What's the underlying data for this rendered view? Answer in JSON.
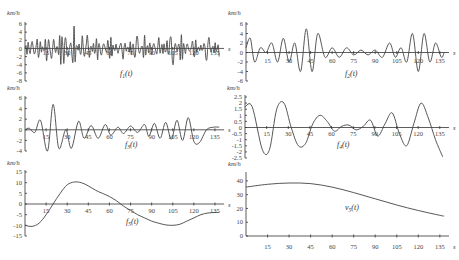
{
  "chart_data": [
    {
      "type": "line",
      "title": "f1(t)",
      "xlabel": "s",
      "ylabel": "km/h",
      "x_ticks": [
        15,
        30,
        45,
        60,
        75,
        90,
        105,
        120,
        135
      ],
      "y_ticks": [
        6,
        4,
        2,
        0,
        -2,
        -4,
        -6,
        -8
      ],
      "ylim": [
        -8,
        6
      ],
      "xlim": [
        0,
        140
      ],
      "description": "High-frequency oscillation, amplitude mostly within ±5 km/h",
      "series": [
        {
          "name": "f1(t)",
          "x": [
            0,
            5,
            10,
            15,
            20,
            25,
            30,
            35,
            40,
            45,
            50,
            55,
            60,
            65,
            70,
            75,
            80,
            85,
            90,
            95,
            100,
            105,
            110,
            115,
            120,
            125,
            130,
            135,
            138
          ],
          "values": [
            0,
            3,
            -3,
            4,
            -4,
            3,
            5,
            -6,
            5,
            -4,
            4,
            -3,
            3,
            -2,
            2,
            -2,
            4,
            -3,
            3,
            -2,
            4,
            -5,
            4,
            -2,
            2,
            -1,
            3,
            -2,
            1
          ]
        }
      ]
    },
    {
      "type": "line",
      "title": "f2(t)",
      "xlabel": "s",
      "ylabel": "km/h",
      "x_ticks": [
        15,
        30,
        45,
        60,
        75,
        90,
        105,
        120,
        135
      ],
      "y_ticks": [
        6,
        4,
        2,
        0,
        -2,
        -4,
        -6
      ],
      "ylim": [
        -6,
        6
      ],
      "xlim": [
        0,
        140
      ],
      "series": [
        {
          "name": "f2(t)",
          "x": [
            0,
            3,
            6,
            10,
            14,
            18,
            22,
            26,
            30,
            34,
            38,
            42,
            46,
            50,
            55,
            60,
            65,
            70,
            75,
            80,
            85,
            90,
            95,
            100,
            104,
            108,
            112,
            116,
            120,
            124,
            128,
            132,
            136,
            138
          ],
          "values": [
            1,
            3,
            -2,
            1,
            0,
            2,
            -2,
            3,
            -2,
            2,
            -4,
            5,
            -4,
            4,
            -1,
            1,
            -1,
            1,
            -0.5,
            0.5,
            -0.5,
            0.5,
            -1,
            2,
            -1,
            1,
            -2,
            4,
            -4,
            4,
            -2,
            2,
            -1,
            0
          ]
        }
      ]
    },
    {
      "type": "line",
      "title": "f3(t)",
      "xlabel": "s",
      "ylabel": "km/h",
      "x_ticks": [
        15,
        30,
        45,
        60,
        75,
        90,
        105,
        120,
        135
      ],
      "y_ticks": [
        6,
        4,
        2,
        0,
        -2,
        -4
      ],
      "ylim": [
        -4,
        6
      ],
      "xlim": [
        0,
        140
      ],
      "series": [
        {
          "name": "f3(t)",
          "x": [
            0,
            3,
            7,
            11,
            16,
            20,
            24,
            29,
            33,
            38,
            42,
            47,
            52,
            57,
            61,
            66,
            70,
            75,
            80,
            85,
            88,
            92,
            96,
            100,
            104,
            108,
            112,
            116,
            120,
            124,
            129,
            134,
            138
          ],
          "values": [
            0,
            0.3,
            -0.5,
            1.8,
            -4,
            4.8,
            -3.5,
            0,
            -3.5,
            1.6,
            -1.6,
            0.8,
            -1.6,
            1,
            -1,
            0.5,
            -0.7,
            0.7,
            -0.5,
            1,
            -1.2,
            1.2,
            -1.6,
            1.4,
            -1.8,
            1.8,
            -2,
            2.3,
            -2.2,
            -2.4,
            0,
            0.5,
            0.5
          ]
        }
      ]
    },
    {
      "type": "line",
      "title": "f4(t)",
      "xlabel": "s",
      "ylabel": "km/h",
      "x_ticks": [
        15,
        30,
        45,
        60,
        75,
        90,
        105,
        120,
        135
      ],
      "y_ticks": [
        2.5,
        2,
        1.5,
        1,
        0.5,
        0,
        -0.5,
        -1,
        -1.5,
        -2,
        -2.5
      ],
      "ylim": [
        -2.5,
        2.5
      ],
      "xlim": [
        0,
        140
      ],
      "series": [
        {
          "name": "f4(t)",
          "x": [
            0,
            5,
            12,
            17,
            22,
            27,
            32,
            37,
            42,
            47,
            52,
            57,
            62,
            67,
            72,
            77,
            82,
            87,
            92,
            97,
            102,
            107,
            112,
            117,
            122,
            127,
            132,
            137
          ],
          "values": [
            1.7,
            1.7,
            -1.8,
            -1.8,
            1.5,
            2,
            0,
            -1.5,
            -1.3,
            0.3,
            1.0,
            0.5,
            -0.3,
            0.1,
            0.2,
            -0.2,
            0.1,
            0.6,
            -0.7,
            0.3,
            1.2,
            -0.5,
            -1.5,
            0.3,
            2,
            0.8,
            -1,
            -2.4
          ]
        }
      ]
    },
    {
      "type": "line",
      "title": "f5(t)",
      "xlabel": "s",
      "ylabel": "km/h",
      "x_ticks": [
        15,
        30,
        45,
        60,
        75,
        90,
        105,
        120,
        135
      ],
      "y_ticks": [
        15,
        10,
        5,
        0,
        -5,
        -10,
        -15
      ],
      "ylim": [
        -15,
        15
      ],
      "xlim": [
        0,
        140
      ],
      "series": [
        {
          "name": "f5(t)",
          "x": [
            0,
            5,
            10,
            15,
            20,
            25,
            30,
            35,
            40,
            45,
            50,
            55,
            60,
            65,
            70,
            75,
            80,
            85,
            90,
            95,
            100,
            105,
            110,
            115,
            120,
            125,
            130,
            135,
            138
          ],
          "values": [
            -10,
            -10.5,
            -9,
            -5,
            0,
            5,
            9,
            10.3,
            10,
            8.5,
            6.5,
            5,
            3.5,
            1.5,
            -1,
            -3,
            -5,
            -6.5,
            -8,
            -9,
            -9.8,
            -10,
            -9.5,
            -8,
            -6.5,
            -5,
            -4.2,
            -4,
            -4
          ]
        }
      ]
    },
    {
      "type": "line",
      "title": "v5(t)",
      "xlabel": "s",
      "ylabel": "km/h",
      "x_ticks": [
        15,
        30,
        45,
        60,
        75,
        90,
        105,
        120,
        135
      ],
      "y_ticks": [
        0,
        10,
        20,
        30,
        40
      ],
      "ylim": [
        0,
        45
      ],
      "xlim": [
        0,
        140
      ],
      "series": [
        {
          "name": "v5(t)",
          "x": [
            0,
            15,
            30,
            45,
            60,
            75,
            90,
            105,
            120,
            135,
            138
          ],
          "values": [
            35.5,
            37.5,
            38.5,
            38,
            35.5,
            31.5,
            27,
            22.5,
            18.5,
            15,
            14.5
          ]
        }
      ]
    }
  ],
  "panels": [
    {
      "label": "f",
      "sub": "1",
      "unit": "km/h",
      "xunit": "s"
    },
    {
      "label": "f",
      "sub": "2",
      "unit": "km/h",
      "xunit": "s"
    },
    {
      "label": "f",
      "sub": "3",
      "unit": "km/h",
      "xunit": "s"
    },
    {
      "label": "f",
      "sub": "4",
      "unit": "km/h",
      "xunit": "s"
    },
    {
      "label": "f",
      "sub": "5",
      "unit": "km/h",
      "xunit": "s"
    },
    {
      "label": "v",
      "sub": "5",
      "unit": "km/h",
      "xunit": "s"
    }
  ]
}
